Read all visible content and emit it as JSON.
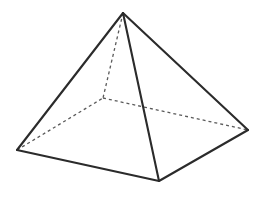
{
  "figure": {
    "shape_type": "square-pyramid",
    "background_color": "#ffffff",
    "visible_edge_color": "#2b2b2b",
    "hidden_edge_color": "#5a5a5a",
    "face_fill_color": "#ffffff",
    "visible_edge_width": 2.1,
    "hidden_edge_width": 1.3,
    "hidden_dash_pattern": "3,3",
    "canvas": {
      "width": 264,
      "height": 219
    }
  },
  "geometry": {
    "vertices": {
      "apex": {
        "label": "apex",
        "x": 123,
        "y": 13,
        "hidden": false
      },
      "base_left": {
        "label": "base-left",
        "x": 17,
        "y": 150,
        "hidden": false
      },
      "base_front": {
        "label": "base-front",
        "x": 159,
        "y": 181,
        "hidden": false
      },
      "base_right": {
        "label": "base-right",
        "x": 248,
        "y": 130,
        "hidden": false
      },
      "base_back": {
        "label": "base-back",
        "x": 103,
        "y": 98,
        "hidden": true
      }
    },
    "visible_edges": [
      {
        "name": "apex-to-base-left",
        "from": "apex",
        "to": "base_left",
        "points": "123,13 17,150"
      },
      {
        "name": "apex-to-base-front",
        "from": "apex",
        "to": "base_front",
        "points": "123,13 159,181"
      },
      {
        "name": "apex-to-base-right",
        "from": "apex",
        "to": "base_right",
        "points": "123,13 248,130"
      },
      {
        "name": "base-left-to-base-front",
        "from": "base_left",
        "to": "base_front",
        "points": "17,150 159,181"
      },
      {
        "name": "base-front-to-base-right",
        "from": "base_front",
        "to": "base_right",
        "points": "159,181 248,130"
      }
    ],
    "hidden_edges": [
      {
        "name": "apex-to-base-back",
        "from": "apex",
        "to": "base_back",
        "points": "123,13 103,98"
      },
      {
        "name": "base-left-to-base-back",
        "from": "base_left",
        "to": "base_back",
        "points": "17,150 103,98"
      },
      {
        "name": "base-back-to-base-right",
        "from": "base_back",
        "to": "base_right",
        "points": "103,98 248,130"
      }
    ],
    "faces": [
      {
        "name": "front-left-face",
        "points": "123,13 17,150 159,181",
        "visible": true
      },
      {
        "name": "front-right-face",
        "points": "123,13 159,181 248,130",
        "visible": true
      }
    ],
    "counts": {
      "vertices": 5,
      "edges": 8,
      "faces": 5
    }
  }
}
